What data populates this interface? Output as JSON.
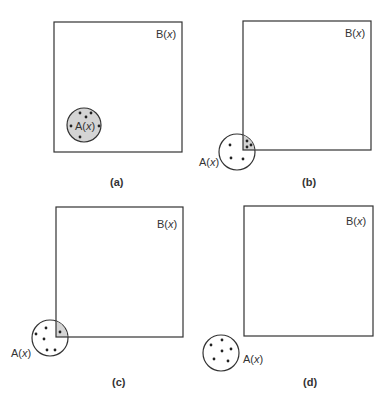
{
  "figure": {
    "panels": [
      {
        "id": "a",
        "caption": "(a)",
        "set_b_label": "B(",
        "set_b_var": "x",
        "set_b_close": ")",
        "set_a_label": "A(",
        "set_a_var": "x",
        "set_a_close": ")",
        "relation": "A fully inside B (A ⊂ B)"
      },
      {
        "id": "b",
        "caption": "(b)",
        "set_b_label": "B(",
        "set_b_var": "x",
        "set_b_close": ")",
        "set_a_label": "A(",
        "set_a_var": "x",
        "set_a_close": ")",
        "relation": "A partially overlaps B (3 points in overlap)"
      },
      {
        "id": "c",
        "caption": "(c)",
        "set_b_label": "B(",
        "set_b_var": "x",
        "set_b_close": ")",
        "set_a_label": "A(",
        "set_a_var": "x",
        "set_a_close": ")",
        "relation": "A slightly overlaps B (1 point in overlap)"
      },
      {
        "id": "d",
        "caption": "(d)",
        "set_b_label": "B(",
        "set_b_var": "x",
        "set_b_close": ")",
        "set_a_label": "A(",
        "set_a_var": "x",
        "set_a_close": ")",
        "relation": "A disjoint from B"
      }
    ],
    "colors": {
      "stroke": "#333333",
      "overlap_fill": "#d4d4d4",
      "background": "#ffffff"
    }
  }
}
